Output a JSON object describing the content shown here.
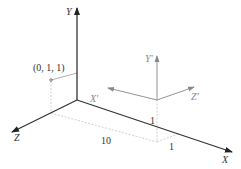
{
  "diagram": {
    "world_axes": {
      "x": "X",
      "y": "Y",
      "z": "Z"
    },
    "local_axes": {
      "x": "X'",
      "y": "Y'",
      "z": "Z'"
    },
    "point_label": "(0, 1, 1)",
    "dimensions": {
      "x_length": "10",
      "y_height": "1",
      "z_depth": "1"
    },
    "colors": {
      "world_axis": "#333333",
      "local_axis": "#888888",
      "dashed": "#bbbbbb"
    }
  }
}
